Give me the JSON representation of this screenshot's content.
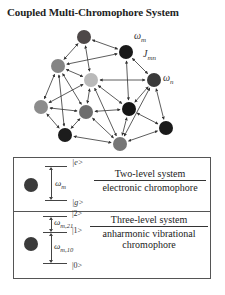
{
  "title": "Coupled Multi-Chromophore System",
  "network": {
    "labels": {
      "omega_m": "ω",
      "omega_m_sub": "m",
      "coupling": "J",
      "coupling_sub": "mn",
      "omega_n": "ω",
      "omega_n_sub": "n"
    },
    "nodes": [
      {
        "id": "A",
        "x": 84,
        "y": 37,
        "color": "#4e4848"
      },
      {
        "id": "B",
        "x": 126,
        "y": 52,
        "color": "#1a1a1a"
      },
      {
        "id": "C",
        "x": 58,
        "y": 66,
        "color": "#858585"
      },
      {
        "id": "D",
        "x": 91,
        "y": 80,
        "color": "#b9b9b9"
      },
      {
        "id": "E",
        "x": 154,
        "y": 80,
        "color": "#3a3a3a"
      },
      {
        "id": "F",
        "x": 41,
        "y": 107,
        "color": "#8c8c8c"
      },
      {
        "id": "G",
        "x": 86,
        "y": 112,
        "color": "#6e6e6e"
      },
      {
        "id": "H",
        "x": 129,
        "y": 109,
        "color": "#161616"
      },
      {
        "id": "I",
        "x": 65,
        "y": 135,
        "color": "#1c1c1c"
      },
      {
        "id": "J",
        "x": 120,
        "y": 144,
        "color": "#767676"
      },
      {
        "id": "K",
        "x": 166,
        "y": 128,
        "color": "#1a1a1a"
      }
    ],
    "edges": [
      [
        "A",
        "B"
      ],
      [
        "A",
        "C"
      ],
      [
        "A",
        "D"
      ],
      [
        "C",
        "B"
      ],
      [
        "C",
        "D"
      ],
      [
        "B",
        "E"
      ],
      [
        "B",
        "H"
      ],
      [
        "D",
        "E"
      ],
      [
        "C",
        "F"
      ],
      [
        "C",
        "G"
      ],
      [
        "C",
        "I"
      ],
      [
        "D",
        "F"
      ],
      [
        "D",
        "G"
      ],
      [
        "D",
        "H"
      ],
      [
        "D",
        "J"
      ],
      [
        "E",
        "H"
      ],
      [
        "E",
        "J"
      ],
      [
        "E",
        "K"
      ],
      [
        "F",
        "G"
      ],
      [
        "F",
        "I"
      ],
      [
        "G",
        "I"
      ],
      [
        "G",
        "H"
      ],
      [
        "G",
        "J"
      ],
      [
        "H",
        "J"
      ],
      [
        "H",
        "K"
      ],
      [
        "I",
        "J"
      ],
      [
        "K",
        "J"
      ]
    ]
  },
  "legend": {
    "two_level": {
      "upper_ket": "|e>",
      "lower_ket": "|g>",
      "omega": "ω",
      "omega_sub": "m",
      "title": "Two-level system",
      "description": "electronic chromophore"
    },
    "three_level": {
      "ket2": "|2>",
      "ket1": "|1>",
      "ket0": "|0>",
      "omega21": "ω",
      "omega21_sub": "m,21",
      "omega10": "ω",
      "omega10_sub": "m,10",
      "title": "Three-level system",
      "description_line1": "anharmonic vibrational",
      "description_line2": "chromophore"
    }
  }
}
